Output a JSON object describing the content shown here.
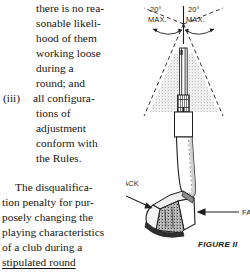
{
  "page": {
    "background": "#ffffff",
    "ink": "#16150f"
  },
  "text_column": {
    "list_item": {
      "lead_lines": [
        "there is no rea-",
        "sonable likeli-",
        "hood of them",
        "working loose",
        "during a",
        "round; and"
      ],
      "marker": "(iii)",
      "marker_lines": [
        "all configura-",
        "tions of",
        "adjustment",
        "conform with",
        "the Rules."
      ]
    },
    "paragraph": {
      "lines": [
        "The disqualifica-",
        "tion penalty for pur-",
        "posely changing the",
        "playing characteristics",
        "of a club during a"
      ],
      "underlined_tail": "stipulated round"
    }
  },
  "figure": {
    "caption": "FIGURE II",
    "annotations": {
      "angle_left_value": "20°",
      "angle_left_unit": "MAX.",
      "angle_right_value": "20°",
      "angle_right_unit": "MAX.",
      "label_back": "BACK",
      "label_face": "FACE"
    },
    "colors": {
      "line": "#1c1c1c",
      "stipple": "#9a9a9a",
      "shade": "#6d6d6d"
    }
  }
}
